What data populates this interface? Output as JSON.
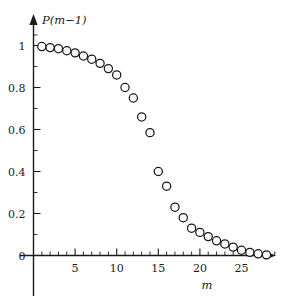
{
  "chart_data": {
    "type": "scatter",
    "title": "",
    "subtitle": "",
    "xlabel": "m",
    "ylabel": "P(m-1)",
    "ylabel_display": "P(m−1)",
    "xlim": [
      0,
      29.5
    ],
    "ylim": [
      -0.04,
      1.09
    ],
    "grid": false,
    "legend": null,
    "marker": "open-circle",
    "marker_color": "#1a1a1a",
    "marker_fill": "#ffffff",
    "x_ticks_major": [
      5,
      10,
      15,
      20,
      25
    ],
    "x_tick_labels": [
      "5",
      "10",
      "15",
      "20",
      "25"
    ],
    "x_ticks_minor": [
      1,
      2,
      3,
      4,
      6,
      7,
      8,
      9,
      11,
      12,
      13,
      14,
      16,
      17,
      18,
      19,
      21,
      22,
      23,
      24,
      26,
      27,
      28,
      29
    ],
    "y_ticks_major": [
      0,
      0.2,
      0.4,
      0.6,
      0.8,
      1
    ],
    "y_tick_labels": [
      "0",
      "0.2",
      "0.4",
      "0.6",
      "0.8",
      "1"
    ],
    "y_ticks_minor": [
      0.1,
      0.3,
      0.5,
      0.7,
      0.9,
      1.05
    ],
    "x": [
      1,
      2,
      3,
      4,
      5,
      6,
      7,
      8,
      9,
      10,
      11,
      12,
      13,
      14,
      15,
      16,
      17,
      18,
      19,
      20,
      21,
      22,
      23,
      24,
      25,
      26,
      27,
      28
    ],
    "values": [
      0.995,
      0.99,
      0.985,
      0.975,
      0.965,
      0.95,
      0.935,
      0.915,
      0.89,
      0.86,
      0.8,
      0.75,
      0.66,
      0.585,
      0.4,
      0.33,
      0.23,
      0.18,
      0.13,
      0.11,
      0.09,
      0.07,
      0.055,
      0.04,
      0.025,
      0.015,
      0.008,
      0.003
    ]
  },
  "axes": {
    "y_axis_label": "P(m−1)",
    "x_axis_label": "m"
  }
}
